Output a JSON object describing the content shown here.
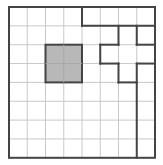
{
  "diagram": {
    "type": "grid-puzzle",
    "rows": 8,
    "cols": 8,
    "colors": {
      "background": "#ffffff",
      "grid_line": "#c8c8c8",
      "outline": "#444444",
      "shaded_cell": "#b8b8b8"
    },
    "shaded_square": {
      "col": 2,
      "row": 2,
      "width": 2,
      "height": 2
    },
    "thick_segments": [
      [
        4,
        0,
        4,
        1
      ],
      [
        4,
        1,
        8,
        1
      ],
      [
        6,
        1,
        6,
        2
      ],
      [
        5,
        2,
        6,
        2
      ],
      [
        5,
        2,
        5,
        3
      ],
      [
        5,
        3,
        6,
        3
      ],
      [
        6,
        3,
        6,
        4
      ],
      [
        6,
        4,
        7,
        4
      ],
      [
        7,
        4,
        7,
        8
      ],
      [
        7,
        1,
        7,
        2
      ],
      [
        7,
        2,
        8,
        2
      ],
      [
        7,
        3,
        8,
        3
      ],
      [
        7,
        3,
        7,
        4
      ]
    ]
  }
}
